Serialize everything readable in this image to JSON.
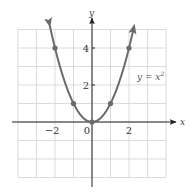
{
  "chart_data": {
    "type": "line",
    "title": "",
    "function": "y = x^2",
    "xlabel": "x",
    "ylabel": "y",
    "xlim": [
      -4,
      4
    ],
    "ylim": [
      -3,
      5
    ],
    "grid": true,
    "grid_step": 1,
    "x_ticks": [
      {
        "value": -2,
        "label": "−2"
      },
      {
        "value": 0,
        "label": "0"
      },
      {
        "value": 2,
        "label": "2"
      }
    ],
    "y_ticks": [
      {
        "value": 2,
        "label": "2"
      },
      {
        "value": 4,
        "label": "4"
      }
    ],
    "series": [
      {
        "name": "y = x²",
        "x": [
          -2,
          -1,
          0,
          1,
          2
        ],
        "y": [
          4,
          1,
          0,
          1,
          4
        ],
        "marked_points": true,
        "arrows_at_ends": true
      }
    ],
    "annotations": [
      {
        "text": "y = x²",
        "x": 2.6,
        "y": 2.8
      }
    ],
    "legend": null
  },
  "labels": {
    "x_axis": "x",
    "y_axis": "y",
    "tick_neg2": "−2",
    "tick_0": "0",
    "tick_2": "2",
    "ytick_2": "2",
    "ytick_4": "4",
    "equation_base": "y = x",
    "equation_exp": "2"
  },
  "colors": {
    "curve": "#6b6b6b",
    "axis": "#222222",
    "grid": "#d2d2d2"
  }
}
